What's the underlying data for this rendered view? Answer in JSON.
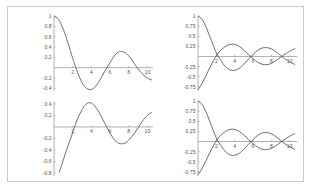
{
  "figure": {
    "panel_count": 4,
    "background": "#ffffff",
    "frame_color": "#c9c9c9",
    "axis_color": "#b0b0b0",
    "curve_color": "#4a4a4a"
  },
  "chart_data": [
    {
      "id": "top-left",
      "type": "line",
      "title": "",
      "xlabel": "",
      "ylabel": "",
      "xlim": [
        0,
        10.6
      ],
      "ylim": [
        -0.45,
        1.0
      ],
      "grid": false,
      "legend": "none",
      "xticks": [
        2,
        4,
        6,
        8,
        10
      ],
      "xtick_labels": [
        "2",
        "4",
        "6",
        "8",
        "10"
      ],
      "yticks": [
        1,
        0.8,
        0.6,
        0.4,
        0.2,
        -0.2,
        -0.4
      ],
      "ytick_labels": [
        "1",
        "0.8",
        "0.6",
        "0.4",
        "0.2",
        "-0.2",
        "-0.4"
      ],
      "series": [
        {
          "name": "damped cosine",
          "x": [
            0,
            0.5,
            1,
            1.5,
            2,
            2.2,
            2.5,
            3,
            3.5,
            4,
            4.5,
            5,
            5.4,
            6,
            6.5,
            7,
            7.5,
            8,
            8.6,
            9,
            9.5,
            10,
            10.5
          ],
          "y": [
            1.0,
            0.93,
            0.74,
            0.48,
            0.18,
            0.08,
            -0.08,
            -0.29,
            -0.4,
            -0.42,
            -0.35,
            -0.21,
            -0.08,
            0.1,
            0.24,
            0.31,
            0.3,
            0.23,
            0.08,
            -0.02,
            -0.13,
            -0.2,
            -0.24
          ]
        }
      ]
    },
    {
      "id": "top-right",
      "type": "line",
      "title": "",
      "xlabel": "",
      "ylabel": "",
      "xlim": [
        0,
        10.8
      ],
      "ylim": [
        -0.85,
        1.0
      ],
      "grid": false,
      "legend": "none",
      "xticks": [
        2,
        4,
        6,
        8,
        10
      ],
      "xtick_labels": [
        "2",
        "4",
        "6",
        "8",
        "10"
      ],
      "yticks": [
        1,
        0.75,
        0.5,
        0.25,
        -0.25,
        -0.5,
        -0.75
      ],
      "ytick_labels": [
        "1",
        "0.75",
        "0.5",
        "0.25",
        "-0.25",
        "-0.5",
        "-0.75"
      ],
      "series": [
        {
          "name": "damped cosine",
          "x": [
            0,
            0.5,
            1,
            1.5,
            2,
            2.4,
            3,
            3.5,
            4,
            4.5,
            5,
            5.5,
            6,
            6.5,
            7,
            7.5,
            8,
            8.5,
            9,
            9.5,
            10,
            10.6
          ],
          "y": [
            1.0,
            0.9,
            0.66,
            0.37,
            0.09,
            -0.07,
            -0.25,
            -0.33,
            -0.34,
            -0.29,
            -0.19,
            -0.07,
            0.05,
            0.15,
            0.21,
            0.22,
            0.19,
            0.12,
            0.03,
            -0.06,
            -0.13,
            -0.2
          ]
        },
        {
          "name": "damped sine (rising)",
          "x": [
            0,
            0.3,
            0.7,
            1.1,
            1.5,
            2,
            2.4,
            3,
            3.5,
            4,
            4.5,
            5,
            5.5,
            6,
            6.5,
            7,
            7.5,
            8,
            8.5,
            9,
            9.5,
            10,
            10.6
          ],
          "y": [
            -0.82,
            -0.72,
            -0.55,
            -0.36,
            -0.18,
            0.02,
            0.14,
            0.25,
            0.3,
            0.3,
            0.25,
            0.16,
            0.05,
            -0.05,
            -0.14,
            -0.19,
            -0.2,
            -0.17,
            -0.1,
            -0.02,
            0.06,
            0.13,
            0.2
          ]
        }
      ]
    },
    {
      "id": "bottom-left",
      "type": "line",
      "title": "",
      "xlabel": "",
      "ylabel": "",
      "xlim": [
        0,
        10.6
      ],
      "ylim": [
        -0.85,
        0.45
      ],
      "grid": false,
      "legend": "none",
      "xticks": [
        2,
        4,
        6,
        8,
        10
      ],
      "xtick_labels": [
        "2",
        "4",
        "6",
        "8",
        "10"
      ],
      "yticks": [
        0.4,
        0.2,
        -0.2,
        -0.4,
        -0.6,
        -0.8
      ],
      "ytick_labels": [
        "0.4",
        "0.2",
        "-0.2",
        "-0.4",
        "-0.6",
        "-0.8"
      ],
      "series": [
        {
          "name": "damped sine",
          "x": [
            0.55,
            0.9,
            1.3,
            1.7,
            2.1,
            2.5,
            3,
            3.4,
            3.8,
            4.2,
            4.7,
            5.2,
            5.7,
            6.2,
            6.7,
            7.1,
            7.6,
            8.1,
            8.6,
            9.1,
            9.6,
            10,
            10.5
          ],
          "y": [
            -0.79,
            -0.62,
            -0.42,
            -0.24,
            -0.05,
            0.13,
            0.3,
            0.39,
            0.42,
            0.39,
            0.29,
            0.14,
            -0.02,
            -0.16,
            -0.26,
            -0.29,
            -0.28,
            -0.21,
            -0.11,
            0.01,
            0.13,
            0.2,
            0.26
          ]
        }
      ]
    },
    {
      "id": "bottom-right",
      "type": "line",
      "title": "",
      "xlabel": "",
      "ylabel": "",
      "xlim": [
        0,
        10.8
      ],
      "ylim": [
        -0.85,
        1.0
      ],
      "grid": false,
      "legend": "none",
      "xticks": [
        2,
        4,
        6,
        8,
        10
      ],
      "xtick_labels": [
        "2",
        "4",
        "6",
        "8",
        "10"
      ],
      "yticks": [
        1,
        0.75,
        0.5,
        0.25,
        -0.25,
        -0.5,
        -0.75
      ],
      "ytick_labels": [
        "1",
        "0.75",
        "0.5",
        "0.25",
        "-0.25",
        "-0.5",
        "-0.75"
      ],
      "series": [
        {
          "name": "damped cosine",
          "x": [
            0,
            0.5,
            1,
            1.5,
            2,
            2.4,
            3,
            3.5,
            4,
            4.5,
            5,
            5.5,
            6,
            6.5,
            7,
            7.5,
            8,
            8.5,
            9,
            9.5,
            10,
            10.6
          ],
          "y": [
            1.0,
            0.9,
            0.66,
            0.37,
            0.09,
            -0.07,
            -0.25,
            -0.33,
            -0.34,
            -0.29,
            -0.19,
            -0.07,
            0.05,
            0.15,
            0.21,
            0.22,
            0.19,
            0.12,
            0.03,
            -0.06,
            -0.13,
            -0.2
          ]
        },
        {
          "name": "damped sine (rising)",
          "x": [
            0,
            0.3,
            0.7,
            1.1,
            1.5,
            2,
            2.4,
            3,
            3.5,
            4,
            4.5,
            5,
            5.5,
            6,
            6.5,
            7,
            7.5,
            8,
            8.5,
            9,
            9.5,
            10,
            10.6
          ],
          "y": [
            -0.82,
            -0.72,
            -0.55,
            -0.36,
            -0.18,
            0.02,
            0.14,
            0.25,
            0.3,
            0.3,
            0.25,
            0.16,
            0.05,
            -0.05,
            -0.14,
            -0.19,
            -0.2,
            -0.17,
            -0.1,
            -0.02,
            0.06,
            0.13,
            0.2
          ]
        }
      ]
    }
  ]
}
